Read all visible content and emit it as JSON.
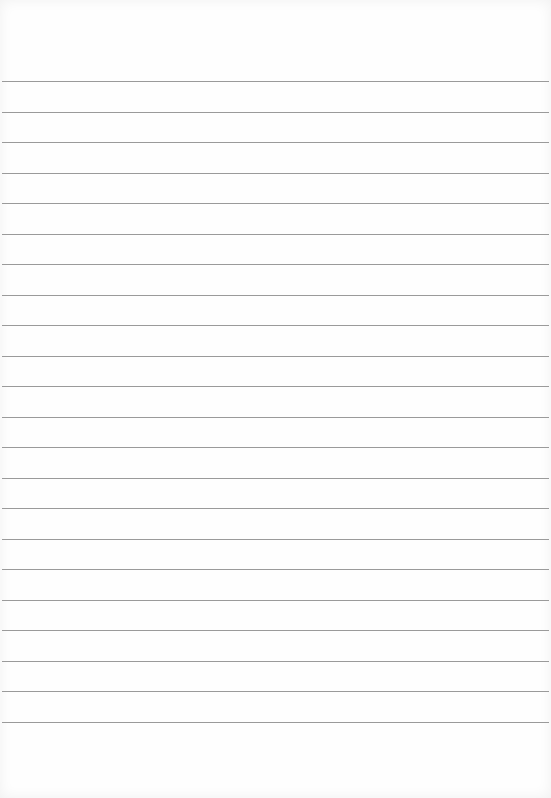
{
  "page": {
    "type": "lined-paper",
    "line_color": "#9a9a9a",
    "background": "#fefefe",
    "first_line_y": 81,
    "line_spacing": 30.5,
    "line_count": 22
  }
}
